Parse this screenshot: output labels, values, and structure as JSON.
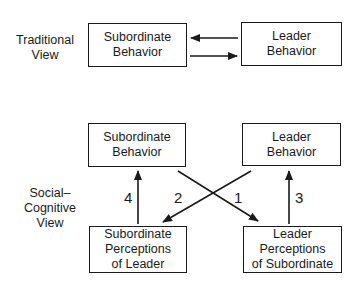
{
  "traditional": {
    "label_lines": [
      "Traditional",
      "View"
    ],
    "subordinate_box": [
      "Subordinate",
      "Behavior"
    ],
    "leader_box": [
      "Leader",
      "Behavior"
    ]
  },
  "social_cognitive": {
    "label_lines": [
      "Social–",
      "Cognitive",
      "View"
    ],
    "subordinate_behavior_box": [
      "Subordinate",
      "Behavior"
    ],
    "leader_behavior_box": [
      "Leader",
      "Behavior"
    ],
    "subordinate_perceptions_box": [
      "Subordinate",
      "Perceptions",
      "of Leader"
    ],
    "leader_perceptions_box": [
      "Leader",
      "Perceptions",
      "of Subordinate"
    ],
    "arrows": [
      {
        "label": "1",
        "from": "Subordinate Behavior",
        "to": "Leader Perceptions of Subordinate"
      },
      {
        "label": "2",
        "from": "Leader Behavior",
        "to": "Subordinate Perceptions of Leader"
      },
      {
        "label": "3",
        "from": "Leader Perceptions of Subordinate",
        "to": "Leader Behavior"
      },
      {
        "label": "4",
        "from": "Subordinate Perceptions of Leader",
        "to": "Subordinate Behavior"
      }
    ]
  }
}
